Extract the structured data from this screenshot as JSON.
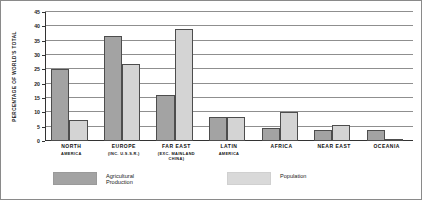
{
  "chart_data": {
    "type": "bar",
    "title": "",
    "subtitle": "",
    "xlabel": "",
    "ylabel": "PERCENTAGE OF WORLD'S TOTAL",
    "ylim": [
      0,
      45
    ],
    "ytick_labels": [
      "0",
      "5",
      "10",
      "15",
      "20",
      "25",
      "30",
      "35",
      "40",
      "45"
    ],
    "ytick_values": [
      0,
      5,
      10,
      15,
      20,
      25,
      30,
      35,
      40,
      45
    ],
    "grid": true,
    "legend_position": "bottom",
    "categories": [
      "NORTH AMERICA",
      "EUROPE (INC. U.S.S.R.)",
      "FAR EAST (EXC. MAINLAND CHINA)",
      "LATIN AMERICA",
      "AFRICA",
      "NEAR EAST",
      "OCEANIA"
    ],
    "category_labels": [
      {
        "main": "NORTH",
        "sub": "AMERICA",
        "sub2": ""
      },
      {
        "main": "EUROPE",
        "sub": "(INC. U.S.S.R.)",
        "sub2": ""
      },
      {
        "main": "FAR EAST",
        "sub": "(EXC. MAINLAND",
        "sub2": "CHINA)"
      },
      {
        "main": "LATIN",
        "sub": "AMERICA",
        "sub2": ""
      },
      {
        "main": "AFRICA",
        "sub": "",
        "sub2": ""
      },
      {
        "main": "NEAR EAST",
        "sub": "",
        "sub2": ""
      },
      {
        "main": "OCEANIA",
        "sub": "",
        "sub2": ""
      }
    ],
    "series": [
      {
        "name": "Agricultural Production",
        "color": "#a3a3a3",
        "values": [
          25,
          36.7,
          16,
          8.5,
          4.5,
          4,
          3.7
        ]
      },
      {
        "name": "Population",
        "color": "#d4d4d4",
        "values": [
          7.5,
          27,
          39,
          8.5,
          10,
          5.5,
          0.5
        ]
      }
    ]
  },
  "legend": {
    "items": [
      {
        "label": "Agricultural\nProduction",
        "swatch": "agri"
      },
      {
        "label": "Population",
        "swatch": "pop"
      }
    ]
  }
}
